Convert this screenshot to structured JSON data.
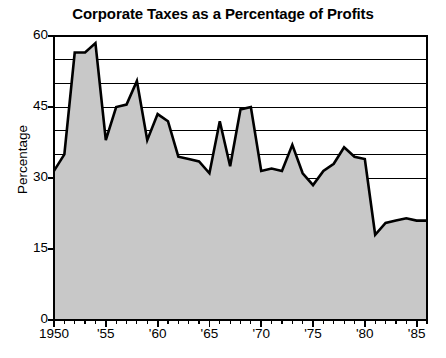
{
  "chart_data": {
    "type": "area",
    "title": "Corporate Taxes as a Percentage of Profits",
    "xlabel": "",
    "ylabel": "Percentage",
    "ylim": [
      0,
      60
    ],
    "xlim": [
      1950,
      1986
    ],
    "y_ticks": [
      0,
      15,
      30,
      45,
      60
    ],
    "y_tick_labels": [
      "0",
      "15",
      "30",
      "45",
      "60"
    ],
    "y_gridlines": [
      35,
      40,
      45,
      50,
      55
    ],
    "grid": true,
    "legend": null,
    "x_ticks": [
      1950,
      1955,
      1960,
      1965,
      1970,
      1975,
      1980,
      1985
    ],
    "x_tick_labels": [
      "1950",
      "'55",
      "'60",
      "'65",
      "'70",
      "'75",
      "'80",
      "'85"
    ],
    "x_minor_tick_interval": 1,
    "fill_color": "#c8c8c8",
    "line_color": "#000000",
    "axis_color": "#000000",
    "grid_color": "#000000",
    "background_color": "#ffffff",
    "x": [
      1950,
      1951,
      1952,
      1953,
      1954,
      1955,
      1956,
      1957,
      1958,
      1959,
      1960,
      1961,
      1962,
      1963,
      1964,
      1965,
      1966,
      1967,
      1968,
      1969,
      1970,
      1971,
      1972,
      1973,
      1974,
      1975,
      1976,
      1977,
      1978,
      1979,
      1980,
      1981,
      1982,
      1983,
      1984,
      1985,
      1986
    ],
    "values": [
      31.5,
      35.0,
      56.5,
      56.5,
      58.5,
      38.0,
      45.0,
      45.5,
      50.5,
      38.0,
      43.5,
      42.0,
      34.5,
      34.0,
      33.5,
      31.0,
      42.0,
      32.5,
      44.5,
      45.0,
      31.5,
      32.0,
      31.5,
      37.0,
      31.0,
      28.5,
      31.5,
      33.0,
      36.5,
      34.5,
      34.0,
      18.0,
      20.5,
      21.0,
      21.5,
      21.0,
      21.0
    ],
    "series_name": "Corporate taxes as a percentage of profits"
  }
}
